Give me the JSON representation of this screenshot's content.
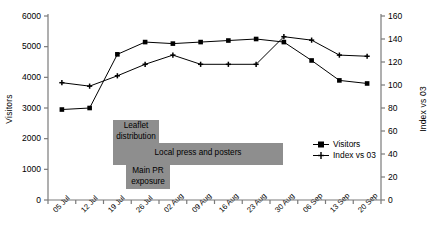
{
  "chart_data": {
    "type": "line",
    "title": "",
    "xlabel": "",
    "grid": false,
    "legend_position": "right-middle",
    "categories": [
      "05 Jul",
      "12 Jul",
      "19 Jul",
      "26 Jul",
      "02 Aug",
      "09 Aug",
      "16 Aug",
      "23 Aug",
      "30 Aug",
      "06 Sep",
      "13 Sep",
      "20 Sep"
    ],
    "axes": {
      "left": {
        "label": "Visitors",
        "ylim": [
          0,
          6000
        ],
        "ticks": [
          0,
          1000,
          2000,
          3000,
          4000,
          5000,
          6000
        ],
        "tick_labels": [
          "0",
          "1000",
          "2000",
          "3000",
          "4000",
          "5000",
          "6000"
        ]
      },
      "right": {
        "label": "Index vs 03",
        "ylim": [
          0,
          160
        ],
        "ticks": [
          0,
          20,
          40,
          60,
          80,
          100,
          120,
          140,
          160
        ],
        "tick_labels": [
          "0",
          "20",
          "40",
          "60",
          "80",
          "100",
          "120",
          "140",
          "160"
        ]
      }
    },
    "series": [
      {
        "name": "Visitors",
        "axis": "left",
        "marker": "square",
        "color": "#000000",
        "values": [
          2950,
          3000,
          4750,
          5150,
          5100,
          5150,
          5200,
          5250,
          5150,
          4550,
          3900,
          3800
        ]
      },
      {
        "name": "Index vs 03",
        "axis": "right",
        "marker": "plus",
        "color": "#000000",
        "values": [
          102,
          99,
          108,
          118,
          126,
          118,
          118,
          118,
          142,
          139,
          126,
          125
        ]
      }
    ],
    "annotations": [
      {
        "id": "leaflet",
        "text": "Leaflet distribution",
        "color": "#8e8e8e"
      },
      {
        "id": "press",
        "text": "Local press and posters",
        "color": "#8e8e8e"
      },
      {
        "id": "pr",
        "text": "Main PR exposure",
        "color": "#8e8e8e"
      }
    ]
  },
  "legend": {
    "items": [
      {
        "label": "Visitors"
      },
      {
        "label": "Index vs 03"
      }
    ]
  }
}
